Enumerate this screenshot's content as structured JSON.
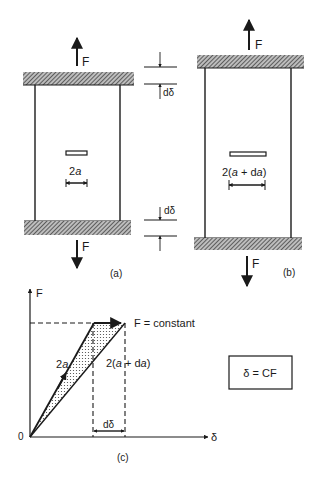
{
  "figure": {
    "panel_a": {
      "label": "(a)",
      "force_top": "F",
      "force_bottom": "F",
      "crack_label_num": "2",
      "crack_label_var": "a",
      "displacement_top": "dδ",
      "displacement_bottom": "dδ"
    },
    "panel_b": {
      "label": "(b)",
      "force_top": "F",
      "force_bottom": "F",
      "crack_label_pre": "2(",
      "crack_label_a": "a",
      "crack_label_mid": " + d",
      "crack_label_da": "a",
      "crack_label_post": ")"
    },
    "panel_c": {
      "label": "(c)",
      "y_axis_label": "F",
      "x_axis_label": "δ",
      "origin_label": "0",
      "line1_label_num": "2",
      "line1_label_var": "a",
      "line2_label_pre": "2(",
      "line2_label_a": "a",
      "line2_label_mid": " + d",
      "line2_label_da": "a",
      "line2_label_post": ")",
      "force_annotation": "F = constant",
      "displacement_increment": "dδ"
    },
    "equation_box": {
      "text": "δ = CF"
    },
    "colors": {
      "ink": "#1a1a1a",
      "hatch": "#555555",
      "background": "#ffffff"
    }
  }
}
